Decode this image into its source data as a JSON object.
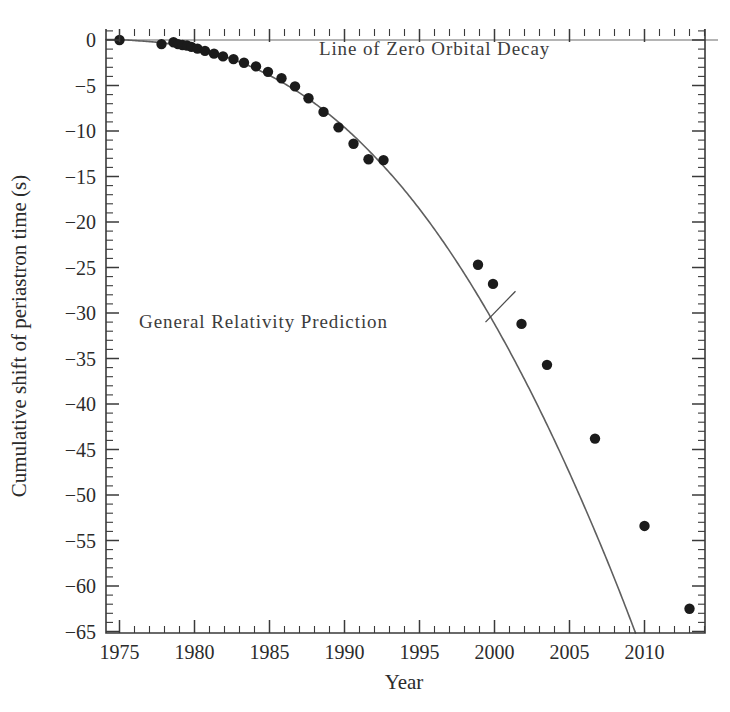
{
  "chart_data": {
    "type": "line",
    "title": "",
    "xlabel": "Year",
    "ylabel": "Cumulative shift of periastron time (s)",
    "xlim": [
      1974.1,
      2014.9
    ],
    "ylim": [
      -65,
      1.2
    ],
    "xticks": [
      1975,
      1980,
      1985,
      1990,
      1995,
      2000,
      2005,
      2010
    ],
    "xticklabels": [
      "1975",
      "1980",
      "1985",
      "1990",
      "1995",
      "2000",
      "2005",
      "2010"
    ],
    "x_minor_step": 1,
    "yticks": [
      0,
      -5,
      -10,
      -15,
      -20,
      -25,
      -30,
      -35,
      -40,
      -45,
      -50,
      -55,
      -60,
      -65
    ],
    "yticklabels": [
      "0",
      "-5",
      "-10",
      "-15",
      "-20",
      "-25",
      "-30",
      "-35",
      "-40",
      "-45",
      "-50",
      "-55",
      "-60",
      "-65"
    ],
    "y_minor_step": 1,
    "grid": false,
    "legend": "none",
    "annotations": [
      {
        "name": "zero-decay-label",
        "text": "Line of Zero Orbital Decay",
        "x": 1996.0,
        "y": -1.6
      },
      {
        "name": "gr-prediction-label",
        "text": "General Relativity Prediction",
        "x": 1984.6,
        "y": -31.6,
        "leader_from": [
          1999.4,
          -31.0
        ],
        "leader_to": [
          2001.4,
          -27.6
        ]
      }
    ],
    "series": [
      {
        "name": "Line of Zero Orbital Decay",
        "type": "line",
        "style": "thin-solid",
        "color": "#6b6b6b",
        "x": [
          1974.1,
          2014.9
        ],
        "values": [
          0,
          0
        ]
      },
      {
        "name": "General Relativity Prediction",
        "type": "line",
        "style": "solid",
        "color": "#5f5f5f",
        "x": [
          1974.5,
          1976,
          1978,
          1980,
          1982,
          1984,
          1986,
          1988,
          1990,
          1992,
          1994,
          1996,
          1998,
          2000,
          2002,
          2004,
          2006,
          2008,
          2010,
          2012,
          2014,
          2014.9
        ],
        "values": [
          0.05,
          -0.06,
          -0.35,
          -0.92,
          -1.82,
          -3.1,
          -4.8,
          -6.95,
          -9.6,
          -12.8,
          -16.5,
          -20.8,
          -25.7,
          -31.2,
          -37.3,
          -44.0,
          -51.3,
          -59.2,
          -67.8,
          -77.0,
          -86.8,
          -91.3
        ]
      },
      {
        "name": "Measured orbital phase shift (data points)",
        "type": "scatter",
        "marker": "filled-circle",
        "color": "#1b1b1b",
        "x": [
          1975.0,
          1977.8,
          1978.6,
          1978.9,
          1979.2,
          1979.5,
          1979.8,
          1980.2,
          1980.7,
          1981.3,
          1981.9,
          1982.6,
          1983.3,
          1984.1,
          1984.9,
          1985.8,
          1986.7,
          1987.6,
          1988.6,
          1989.6,
          1990.6,
          1991.6,
          1992.6,
          1998.9,
          1999.9,
          2001.8,
          2003.5,
          2006.7,
          2010.0,
          2013.0
        ],
        "values": [
          0.0,
          -0.45,
          -0.25,
          -0.45,
          -0.55,
          -0.6,
          -0.75,
          -0.95,
          -1.2,
          -1.5,
          -1.8,
          -2.1,
          -2.5,
          -2.9,
          -3.5,
          -4.2,
          -5.1,
          -6.4,
          -7.9,
          -9.6,
          -11.4,
          -13.1,
          -13.2,
          -24.7,
          -26.8,
          -31.2,
          -35.7,
          -43.8,
          -53.4,
          -62.5
        ]
      }
    ],
    "data_points_visible": 30,
    "observation_gap": {
      "from": 1993,
      "to": 1998
    }
  },
  "axis": {
    "x_label": "Year",
    "y_label": "Cumulative shift of periastron time (s)"
  },
  "colors": {
    "background": "#ffffff",
    "axis": "#3a3a3a",
    "text": "#2b2b2b",
    "curve": "#5f5f5f",
    "zero_line": "#6b6b6b",
    "marker": "#1b1b1b"
  }
}
